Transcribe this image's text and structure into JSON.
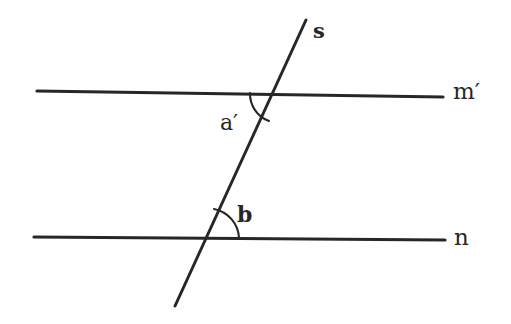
{
  "figure": {
    "background_color": "#ffffff",
    "stroke_color": "#272727",
    "label_color": "#272727",
    "width": 511,
    "height": 324
  },
  "lines": {
    "m_prime": {
      "label": "m′",
      "role": "upper-parallel-line",
      "x1": 37,
      "y1": 91,
      "x2": 443,
      "y2": 97,
      "stroke_width": 3.2
    },
    "n": {
      "label": "n",
      "role": "lower-parallel-line",
      "x1": 34,
      "y1": 237,
      "x2": 445,
      "y2": 240,
      "stroke_width": 3.2
    },
    "s": {
      "label": "s",
      "role": "transversal-line",
      "x1": 306,
      "y1": 20,
      "x2": 175,
      "y2": 306,
      "stroke_width": 3.0
    }
  },
  "intersections": {
    "upper": {
      "x": 278,
      "y": 95,
      "lines": [
        "m′",
        "s"
      ]
    },
    "lower": {
      "x": 208,
      "y": 238,
      "lines": [
        "n",
        "s"
      ]
    }
  },
  "angles": [
    {
      "label": "a′",
      "name": "angle-a-prime",
      "vertex": "upper",
      "arc_start": {
        "x": 250,
        "y": 93
      },
      "arc_end": {
        "x": 269,
        "y": 121
      },
      "arc_radius": 29,
      "label_x": 220,
      "label_y": 112
    },
    {
      "label": "b",
      "name": "angle-b",
      "vertex": "lower",
      "arc_start": {
        "x": 214,
        "y": 209
      },
      "arc_end": {
        "x": 239,
        "y": 238
      },
      "arc_radius": 31,
      "label_x": 237,
      "label_y": 203
    }
  ]
}
